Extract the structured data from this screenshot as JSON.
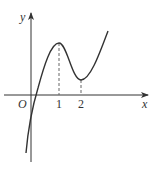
{
  "figure": {
    "type": "function-graph",
    "axes": {
      "x_label": "x",
      "y_label": "y",
      "origin_label": "O"
    },
    "ticks": {
      "x": [
        {
          "value": 1,
          "label": "1"
        },
        {
          "value": 2,
          "label": "2"
        }
      ]
    },
    "features": {
      "local_max_x": 1,
      "local_min_x": 2,
      "dashed_guides_at": [
        1,
        2
      ]
    },
    "colors": {
      "curve": "#333333",
      "axes": "#333333",
      "guides": "#666666"
    }
  }
}
